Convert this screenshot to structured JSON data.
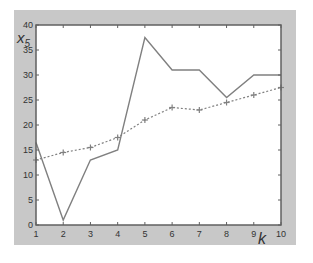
{
  "chart_data": {
    "type": "line",
    "title": "",
    "xlabel": "k",
    "ylabel": "x5",
    "ylabel_main": "x",
    "ylabel_sub": "5",
    "x": [
      1,
      2,
      3,
      4,
      5,
      6,
      7,
      8,
      9,
      10
    ],
    "xlim": [
      1,
      10
    ],
    "ylim": [
      0,
      40
    ],
    "xticks": [
      1,
      2,
      3,
      4,
      5,
      6,
      7,
      8,
      9,
      10
    ],
    "yticks": [
      0,
      5,
      10,
      15,
      20,
      25,
      30,
      35,
      40
    ],
    "grid": false,
    "legend": null,
    "series": [
      {
        "name": "solid",
        "style": "solid",
        "marker": "none",
        "color": "#808080",
        "values": [
          16.5,
          1,
          13,
          15,
          37.5,
          31,
          31,
          25.5,
          30,
          30
        ]
      },
      {
        "name": "dotted",
        "style": "dotted",
        "marker": "+",
        "color": "#808080",
        "values": [
          13,
          14.5,
          15.5,
          17.5,
          21,
          23.5,
          23,
          24.5,
          26,
          27.5
        ]
      }
    ]
  },
  "colors": {
    "frame": "#c8c8c8",
    "plot_bg": "#ffffff",
    "axis": "#606060",
    "text": "#333333"
  }
}
